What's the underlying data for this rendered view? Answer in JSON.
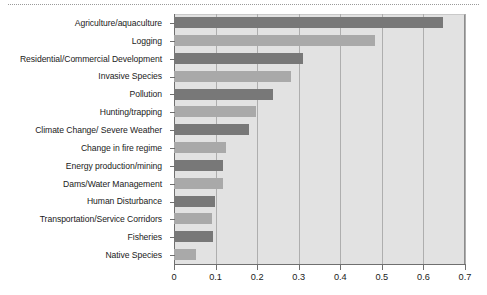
{
  "chart_data": {
    "type": "bar",
    "orientation": "horizontal",
    "title": "",
    "subtitle": "",
    "xlabel": "",
    "ylabel": "",
    "xlim": [
      0,
      0.7
    ],
    "xticks": [
      "0",
      "0.1",
      "0.2",
      "0.3",
      "0.4",
      "0.5",
      "0.6",
      "0.7"
    ],
    "xtick_values": [
      0,
      0.1,
      0.2,
      0.3,
      0.4,
      0.5,
      0.6,
      0.7
    ],
    "grid": "vertical",
    "legend": "none",
    "plot_background": "#e2e2e2",
    "colors": {
      "bar_dark": "#787878",
      "bar_light": "#a9a9a9",
      "axis": "#6f6f6f",
      "gridline": "#aeaeae",
      "plot_bg": "#e2e2e2",
      "text": "#1a1a1a"
    },
    "categories": [
      "Agriculture/aquaculture",
      "Logging",
      "Residential/Commercial Development",
      "Invasive Species",
      "Pollution",
      "Hunting/trapping",
      "Climate Change/ Severe Weather",
      "Change in fire regime",
      "Energy production/mining",
      "Dams/Water Management",
      "Human Disturbance",
      "Transportation/Service Corridors",
      "Fisheries",
      "Native Species"
    ],
    "values": [
      0.647,
      0.483,
      0.31,
      0.281,
      0.238,
      0.197,
      0.18,
      0.125,
      0.118,
      0.118,
      0.099,
      0.091,
      0.094,
      0.053
    ],
    "bar_shades": [
      "dark",
      "light",
      "dark",
      "light",
      "dark",
      "light",
      "dark",
      "light",
      "dark",
      "light",
      "dark",
      "light",
      "dark",
      "light"
    ]
  }
}
